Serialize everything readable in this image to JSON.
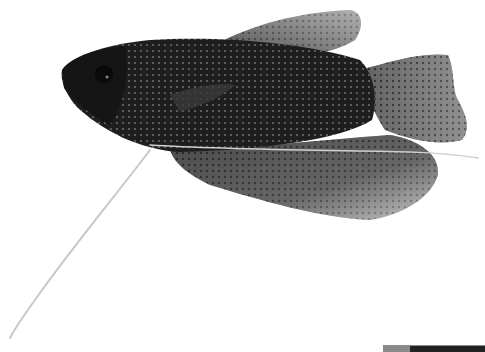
{
  "image": {
    "subject": "gourami fish",
    "description": "Dark fish with pearl-dotted scales on white background, long thin ventral filament extending down-left",
    "colors": {
      "background": "#ffffff",
      "body": "#1c1c1c",
      "fin_light": "#cfcfcf"
    }
  },
  "watermark": {
    "text": ""
  }
}
